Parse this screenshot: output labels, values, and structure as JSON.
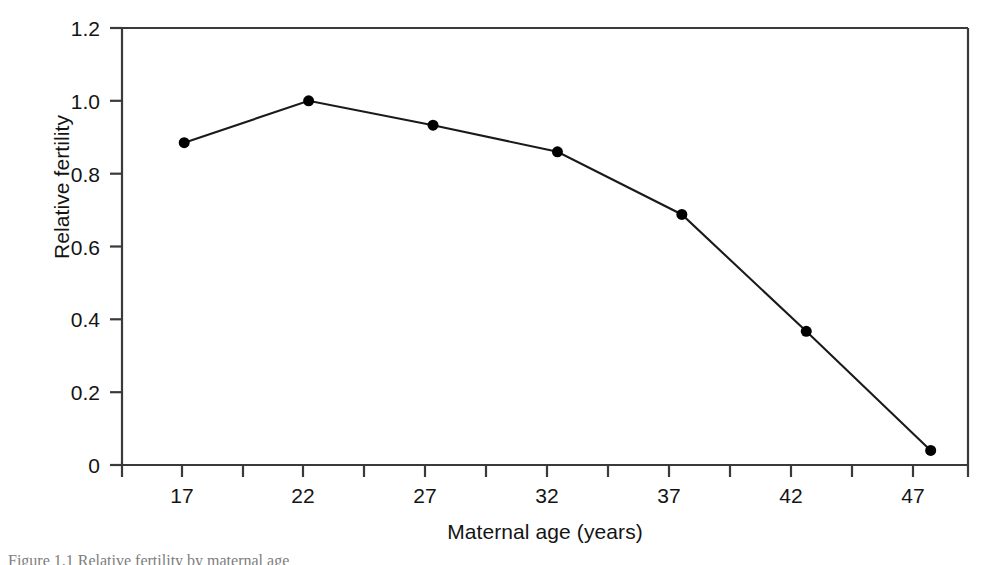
{
  "figure": {
    "background_color": "#ffffff",
    "line_color": "#1a1a1a",
    "marker_color": "#000000",
    "axis_color": "#3a3a3a",
    "caption_text": "Figure 1.1   Relative fertility by maternal age"
  },
  "axes": {
    "x_title": "Maternal age (years)",
    "y_title": "Relative fertility",
    "x_ticks": [
      "17",
      "22",
      "27",
      "32",
      "37",
      "42",
      "47"
    ],
    "y_ticks": [
      "0",
      "0.2",
      "0.4",
      "0.6",
      "0.8",
      "1.0",
      "1.2"
    ]
  },
  "chart_data": {
    "type": "line",
    "title": "",
    "xlabel": "Maternal age (years)",
    "ylabel": "Relative fertility",
    "x": [
      17,
      22,
      27,
      32,
      37,
      42,
      47
    ],
    "values": [
      0.885,
      1.0,
      0.933,
      0.86,
      0.688,
      0.367,
      0.04
    ],
    "categories": [
      "17",
      "22",
      "27",
      "32",
      "37",
      "42",
      "47"
    ],
    "series": [
      {
        "name": "Relative fertility",
        "values": [
          0.885,
          1.0,
          0.933,
          0.86,
          0.688,
          0.367,
          0.04
        ]
      }
    ],
    "xlim": [
      14.5,
      48.5
    ],
    "ylim": [
      0,
      1.2
    ],
    "xticks": [
      17,
      22,
      27,
      32,
      37,
      42,
      47
    ],
    "yticks": [
      0,
      0.2,
      0.4,
      0.6,
      0.8,
      1.0,
      1.2
    ],
    "minor_xticks": [
      14.5,
      19.5,
      24.5,
      29.5,
      34.5,
      39.5,
      44.5
    ],
    "grid": false,
    "legend": "none",
    "marker": "filled-circle",
    "marker_size": 11
  }
}
